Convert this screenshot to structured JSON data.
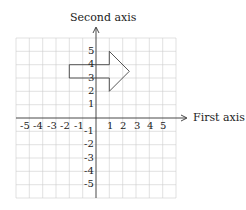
{
  "axes": {
    "x_label": "First axis",
    "y_label": "Second axis",
    "x_ticks": [
      "-5",
      "-4",
      "-3",
      "-2",
      "-1",
      "1",
      "2",
      "3",
      "4",
      "5"
    ],
    "y_ticks_pos": [
      "5",
      "4",
      "3",
      "2",
      "1"
    ],
    "y_ticks_neg": [
      "-1",
      "-2",
      "-3",
      "-4",
      "-5"
    ]
  },
  "shape": {
    "type": "arrow",
    "vertices": [
      [
        -2,
        4
      ],
      [
        1,
        4
      ],
      [
        1,
        5
      ],
      [
        2.5,
        3.5
      ],
      [
        1,
        2
      ],
      [
        1,
        3
      ],
      [
        -2,
        3
      ]
    ]
  },
  "grid": {
    "x_range": [
      -6,
      6
    ],
    "y_range": [
      -6,
      6
    ]
  }
}
